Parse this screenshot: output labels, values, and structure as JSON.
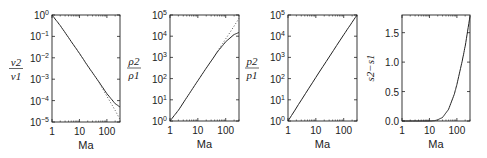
{
  "chart_data": [
    {
      "type": "line",
      "id": "nu-ratio",
      "xscale": "log",
      "yscale": "log",
      "xlabel": "Ma",
      "ylabel": {
        "num": "ν2",
        "den": "ν1"
      },
      "xlim": [
        1,
        300
      ],
      "ylim": [
        1e-05,
        1
      ],
      "xticks": [
        {
          "v": 1,
          "label": "1"
        },
        {
          "v": 10,
          "label": "10"
        },
        {
          "v": 100,
          "label": "100"
        }
      ],
      "yticks": [
        {
          "v": 1,
          "b": "10",
          "e": "0"
        },
        {
          "v": 0.1,
          "b": "10",
          "e": "−1"
        },
        {
          "v": 0.01,
          "b": "10",
          "e": "−2"
        },
        {
          "v": 0.001,
          "b": "10",
          "e": "−3"
        },
        {
          "v": 0.0001,
          "b": "10",
          "e": "−4"
        },
        {
          "v": 1e-05,
          "b": "10",
          "e": "−5"
        }
      ],
      "series": [
        {
          "name": "real gas",
          "style": "solid",
          "x": [
            1,
            2,
            5,
            10,
            20,
            50,
            100,
            200,
            300
          ],
          "y": [
            1,
            0.32,
            0.058,
            0.016,
            0.0042,
            0.00078,
            0.00021,
            7.2e-05,
            5e-05
          ]
        },
        {
          "name": "ideal gas",
          "style": "dotted",
          "x": [
            50,
            100,
            200,
            300
          ],
          "y": [
            0.00078,
            0.00016,
            3.5e-05,
            1.3e-05
          ]
        }
      ]
    },
    {
      "type": "line",
      "id": "rho-ratio",
      "xscale": "log",
      "yscale": "log",
      "xlabel": "Ma",
      "ylabel": {
        "num": "ρ2",
        "den": "ρ1"
      },
      "xlim": [
        1,
        300
      ],
      "ylim": [
        1,
        100000
      ],
      "xticks": [
        {
          "v": 1,
          "label": "1"
        },
        {
          "v": 10,
          "label": "10"
        },
        {
          "v": 100,
          "label": "100"
        }
      ],
      "yticks": [
        {
          "v": 1,
          "b": "10",
          "e": "0"
        },
        {
          "v": 10,
          "b": "10",
          "e": "1"
        },
        {
          "v": 100,
          "b": "10",
          "e": "2"
        },
        {
          "v": 1000,
          "b": "10",
          "e": "3"
        },
        {
          "v": 10000,
          "b": "10",
          "e": "4"
        },
        {
          "v": 100000,
          "b": "10",
          "e": "5"
        }
      ],
      "series": [
        {
          "name": "real gas",
          "style": "solid",
          "x": [
            1,
            2,
            5,
            10,
            20,
            50,
            100,
            200,
            300
          ],
          "y": [
            1,
            3.2,
            20,
            80,
            310,
            1800,
            5500,
            12000,
            15000
          ]
        },
        {
          "name": "ideal gas",
          "style": "dotted",
          "x": [
            50,
            100,
            200,
            300
          ],
          "y": [
            1900,
            7500,
            30000,
            70000
          ]
        }
      ]
    },
    {
      "type": "line",
      "id": "p-ratio",
      "xscale": "log",
      "yscale": "log",
      "xlabel": "Ma",
      "ylabel": {
        "num": "p2",
        "den": "p1"
      },
      "xlim": [
        1,
        300
      ],
      "ylim": [
        1,
        100000
      ],
      "xticks": [
        {
          "v": 1,
          "label": "1"
        },
        {
          "v": 10,
          "label": "10"
        },
        {
          "v": 100,
          "label": "100"
        }
      ],
      "yticks": [
        {
          "v": 1,
          "b": "10",
          "e": "0"
        },
        {
          "v": 10,
          "b": "10",
          "e": "1"
        },
        {
          "v": 100,
          "b": "10",
          "e": "2"
        },
        {
          "v": 1000,
          "b": "10",
          "e": "3"
        },
        {
          "v": 10000,
          "b": "10",
          "e": "4"
        },
        {
          "v": 100000,
          "b": "10",
          "e": "5"
        }
      ],
      "series": [
        {
          "name": "real gas",
          "style": "solid",
          "x": [
            1,
            10,
            100,
            300
          ],
          "y": [
            1,
            115,
            11700,
            100000
          ]
        }
      ]
    },
    {
      "type": "line",
      "id": "entropy-jump",
      "xscale": "log",
      "yscale": "linear",
      "xlabel": "Ma",
      "ylabel": {
        "text": "s2−s1"
      },
      "xlim": [
        1,
        300
      ],
      "ylim": [
        0,
        1.8
      ],
      "xticks": [
        {
          "v": 1,
          "label": "1"
        },
        {
          "v": 10,
          "label": "10"
        },
        {
          "v": 100,
          "label": "100"
        }
      ],
      "yticks": [
        {
          "v": 0,
          "label": "0.0"
        },
        {
          "v": 0.5,
          "label": "0.5"
        },
        {
          "v": 1,
          "label": "1.0"
        },
        {
          "v": 1.5,
          "label": "1.5"
        }
      ],
      "series": [
        {
          "name": "real gas",
          "style": "solid",
          "x": [
            1,
            10,
            15,
            20,
            30,
            50,
            80,
            100,
            150,
            200,
            300
          ],
          "y": [
            0,
            0,
            0.005,
            0.02,
            0.06,
            0.2,
            0.45,
            0.62,
            0.98,
            1.27,
            1.78
          ]
        }
      ]
    }
  ]
}
